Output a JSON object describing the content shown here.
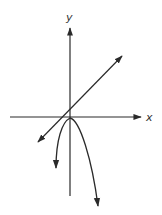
{
  "diagram": {
    "type": "coordinate-graph",
    "labels": {
      "x_axis": "x",
      "y_axis": "y"
    },
    "colors": {
      "stroke": "#2a2a2a",
      "background": "#ffffff"
    },
    "elements": [
      {
        "name": "x-axis",
        "kind": "axis",
        "direction": "horizontal",
        "arrow": "right"
      },
      {
        "name": "y-axis",
        "kind": "axis",
        "direction": "vertical",
        "arrow": "up"
      },
      {
        "name": "line",
        "kind": "straight-line",
        "slope": "positive",
        "arrows": "both ends"
      },
      {
        "name": "parabola",
        "kind": "downward-opening curve",
        "vertex": "near origin",
        "arrows": "both branches"
      }
    ]
  }
}
